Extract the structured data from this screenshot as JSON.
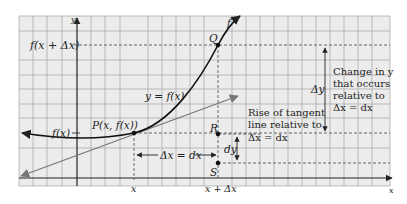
{
  "figure": {
    "background": "#ffffff",
    "grid_bg": "#ececec",
    "grid_line_color": "#9a9a9a",
    "axis_color": "#222222",
    "curve_color": "#111111",
    "tangent_color": "#777777",
    "axis_labels": {
      "x": "x",
      "y": "y"
    },
    "left_labels": {
      "f_x_plus_dx": "f(x + Δx)",
      "f_x": "f(x)"
    },
    "bottom_labels": {
      "x": "x",
      "x_plus_dx": "x + Δx"
    },
    "curve_label": "y = f(x)",
    "curve_end_label": "f",
    "points": {
      "P": "P(x, f(x))",
      "Q": "Q",
      "R": "R",
      "S": "S"
    },
    "dx_label": "Δx = dx",
    "dy_label": "dy",
    "delta_y_label": "Δy",
    "rise_note": [
      "Rise of tangent",
      "line relative to",
      "Δx = dx"
    ],
    "change_note": [
      "Change in y",
      "that occurs",
      "relative to",
      "Δx = dx"
    ]
  }
}
